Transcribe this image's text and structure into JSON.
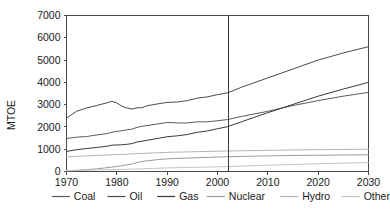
{
  "chart_data": {
    "type": "line",
    "title": "",
    "xlabel": "",
    "ylabel": "MTOE",
    "xlim": [
      1970,
      2030
    ],
    "ylim": [
      0,
      7000
    ],
    "ytick_step": 1000,
    "grid": false,
    "legend_position": "bottom",
    "xticks": [
      "1970",
      "1980",
      "1990",
      "2000",
      "2010",
      "2020",
      "2030"
    ],
    "xtick_values": [
      1970,
      1980,
      1990,
      2000,
      2010,
      2020,
      2030
    ],
    "yticks": [
      "0",
      "1000",
      "2000",
      "3000",
      "4000",
      "5000",
      "6000",
      "7000"
    ],
    "ytick_values": [
      0,
      1000,
      2000,
      3000,
      4000,
      5000,
      6000,
      7000
    ],
    "annotations": [
      {
        "name": "projection-divider",
        "type": "vline",
        "x": 2002
      }
    ],
    "x": [
      1970,
      1972,
      1974,
      1976,
      1978,
      1979,
      1980,
      1981,
      1982,
      1983,
      1984,
      1985,
      1986,
      1988,
      1990,
      1992,
      1994,
      1996,
      1998,
      2000,
      2002,
      2005,
      2010,
      2015,
      2020,
      2025,
      2030
    ],
    "series": [
      {
        "name": "Coal",
        "color": "#5a5a5a",
        "values": [
          1480,
          1540,
          1570,
          1640,
          1700,
          1760,
          1800,
          1830,
          1870,
          1900,
          1980,
          2030,
          2060,
          2130,
          2200,
          2180,
          2180,
          2230,
          2230,
          2280,
          2330,
          2480,
          2700,
          2960,
          3180,
          3380,
          3550
        ]
      },
      {
        "name": "Oil",
        "color": "#4a4a4a",
        "values": [
          2400,
          2700,
          2850,
          2960,
          3080,
          3150,
          3080,
          2930,
          2850,
          2800,
          2860,
          2860,
          2950,
          3030,
          3100,
          3120,
          3180,
          3290,
          3350,
          3450,
          3530,
          3800,
          4200,
          4600,
          5000,
          5320,
          5600
        ]
      },
      {
        "name": "Gas",
        "color": "#3a3a3a",
        "values": [
          900,
          980,
          1030,
          1080,
          1130,
          1180,
          1190,
          1200,
          1220,
          1250,
          1320,
          1360,
          1400,
          1480,
          1560,
          1600,
          1660,
          1760,
          1820,
          1920,
          2010,
          2250,
          2640,
          3010,
          3380,
          3700,
          4000
        ]
      },
      {
        "name": "Nuclear",
        "color": "#9a9a9a",
        "values": [
          20,
          50,
          80,
          120,
          170,
          200,
          220,
          260,
          300,
          340,
          400,
          450,
          480,
          530,
          570,
          590,
          600,
          620,
          630,
          650,
          660,
          680,
          700,
          720,
          730,
          740,
          750
        ]
      },
      {
        "name": "Hydro",
        "color": "#b4b4b4",
        "values": [
          660,
          680,
          700,
          720,
          740,
          750,
          760,
          770,
          780,
          790,
          800,
          810,
          820,
          840,
          860,
          870,
          880,
          890,
          900,
          910,
          920,
          930,
          950,
          965,
          980,
          990,
          1000
        ]
      },
      {
        "name": "Other",
        "color": "#c4c4c4",
        "values": [
          40,
          50,
          60,
          70,
          80,
          85,
          90,
          95,
          100,
          105,
          110,
          120,
          130,
          145,
          160,
          170,
          180,
          190,
          200,
          210,
          220,
          245,
          280,
          315,
          345,
          375,
          400
        ]
      }
    ]
  },
  "legend": {
    "items": [
      {
        "label": "Coal"
      },
      {
        "label": "Oil"
      },
      {
        "label": "Gas"
      },
      {
        "label": "Nuclear"
      },
      {
        "label": "Hydro"
      },
      {
        "label": "Other"
      }
    ]
  }
}
